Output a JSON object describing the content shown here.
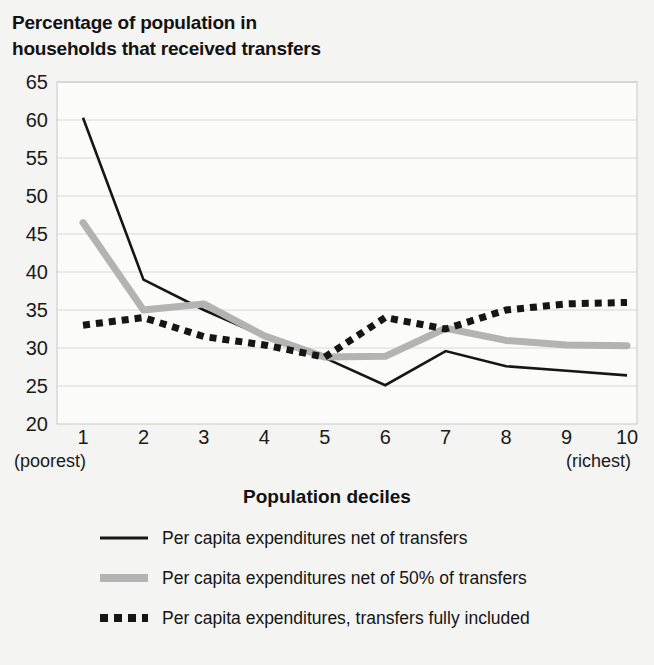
{
  "title": "Percentage of population in\nhouseholds that received transfers",
  "axis": {
    "xlabel": "Population deciles",
    "ylabel": "",
    "x_left_note": "(poorest)",
    "x_right_note": "(richest)"
  },
  "legend": {
    "items": [
      {
        "label": "Per capita expenditures net of transfers",
        "style": "solid-black",
        "color": "#161616"
      },
      {
        "label": "Per capita expenditures net of 50% of transfers",
        "style": "solid-gray",
        "color": "#b3b3b3"
      },
      {
        "label": "Per capita expenditures, transfers fully included",
        "style": "dotted-black",
        "color": "#161616"
      }
    ]
  },
  "chart_data": {
    "type": "line",
    "title": "Percentage of population in households that received transfers",
    "xlabel": "Population deciles",
    "ylabel": "",
    "categories": [
      "1",
      "2",
      "3",
      "4",
      "5",
      "6",
      "7",
      "8",
      "9",
      "10"
    ],
    "x_tick_labels": [
      "1",
      "2",
      "3",
      "4",
      "5",
      "6",
      "7",
      "8",
      "9",
      "10"
    ],
    "y_tick_labels": [
      "20",
      "25",
      "30",
      "35",
      "40",
      "45",
      "50",
      "55",
      "60",
      "65"
    ],
    "y_ticks": [
      20,
      25,
      30,
      35,
      40,
      45,
      50,
      55,
      60,
      65
    ],
    "ylim": [
      20,
      65
    ],
    "xlim": [
      1,
      10
    ],
    "grid": true,
    "legend_position": "bottom",
    "series": [
      {
        "name": "Per capita expenditures net of transfers",
        "color": "#161616",
        "style": "solid",
        "values": [
          60.3,
          39.0,
          35.0,
          31.5,
          28.7,
          25.1,
          29.6,
          27.6,
          27.0,
          26.4
        ]
      },
      {
        "name": "Per capita expenditures net of 50% of transfers",
        "color": "#b3b3b3",
        "style": "solid",
        "values": [
          46.5,
          35.0,
          35.8,
          31.6,
          28.8,
          28.9,
          32.6,
          31.0,
          30.4,
          30.3
        ]
      },
      {
        "name": "Per capita expenditures, transfers fully included",
        "color": "#161616",
        "style": "dotted",
        "values": [
          33.0,
          34.0,
          31.5,
          30.4,
          28.8,
          34.0,
          32.5,
          35.0,
          35.8,
          36.0
        ]
      }
    ]
  }
}
